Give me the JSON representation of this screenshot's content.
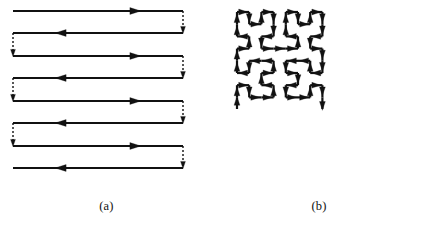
{
  "figure": {
    "background_color": "#ffffff",
    "stroke_color": "#111111",
    "panels": [
      {
        "id": "a",
        "caption": "(a)",
        "path_type": "raster-boustrophedon-scan",
        "description": "Horizontal raster scan lines with alternating direction, joined by dashed vertical retrace connectors.",
        "solid_stroke_width": 2.2,
        "dashed_stroke_width": 1.4,
        "dash_pattern": "2,2",
        "arrow_color": "#111111",
        "geometry": {
          "x_left": 13,
          "x_right": 183,
          "rows": [
            {
              "index": 1,
              "y": 11,
              "direction": "right"
            },
            {
              "index": 2,
              "y": 33,
              "direction": "left"
            },
            {
              "index": 3,
              "y": 56,
              "direction": "right"
            },
            {
              "index": 4,
              "y": 78,
              "direction": "left"
            },
            {
              "index": 5,
              "y": 101,
              "direction": "right"
            },
            {
              "index": 6,
              "y": 123,
              "direction": "left"
            },
            {
              "index": 7,
              "y": 146,
              "direction": "right"
            },
            {
              "index": 8,
              "y": 168,
              "direction": "left"
            }
          ],
          "connectors": [
            {
              "index": 1,
              "side": "right",
              "x": 183,
              "y_from": 11,
              "y_to": 33,
              "style": "dashed"
            },
            {
              "index": 2,
              "side": "left",
              "x": 13,
              "y_from": 33,
              "y_to": 56,
              "style": "dashed"
            },
            {
              "index": 3,
              "side": "right",
              "x": 183,
              "y_from": 56,
              "y_to": 78,
              "style": "dashed"
            },
            {
              "index": 4,
              "side": "left",
              "x": 13,
              "y_from": 78,
              "y_to": 101,
              "style": "dashed"
            },
            {
              "index": 5,
              "side": "right",
              "x": 183,
              "y_from": 101,
              "y_to": 123,
              "style": "dashed"
            },
            {
              "index": 6,
              "side": "left",
              "x": 13,
              "y_from": 123,
              "y_to": 146,
              "style": "dashed"
            },
            {
              "index": 7,
              "side": "right",
              "x": 183,
              "y_from": 146,
              "y_to": 168,
              "style": "dashed"
            }
          ],
          "row_arrow_fraction": 0.72
        }
      },
      {
        "id": "b",
        "caption": "(b)",
        "path_type": "hilbert-space-filling-curve",
        "description": "Order-3 Hilbert curve traversing an 8 by 8 grid of cells, arrowheads on every segment.",
        "solid_stroke_width": 2.2,
        "arrow_color": "#111111",
        "geometry": {
          "order": 3,
          "grid_size": 8,
          "cell_size": 12.2,
          "origin_x": 24,
          "origin_y": 12,
          "start_corner": "bottom-left",
          "end_corner": "bottom-right",
          "segment_count": 63
        }
      }
    ]
  }
}
